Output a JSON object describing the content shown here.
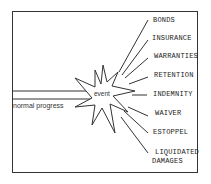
{
  "diagram": {
    "baseline_label": "normal progress",
    "event_label": "event",
    "consequences": [
      {
        "label": "BONDS",
        "x": 153,
        "y": 16
      },
      {
        "label": "INSURANCE",
        "x": 152,
        "y": 34
      },
      {
        "label": "WARRANTIES",
        "x": 154,
        "y": 52
      },
      {
        "label": "RETENTION",
        "x": 154,
        "y": 71
      },
      {
        "label": "INDEMNITY",
        "x": 153,
        "y": 90
      },
      {
        "label": "WAIVER",
        "x": 155,
        "y": 109
      },
      {
        "label": "ESTOPPEL",
        "x": 153,
        "y": 128
      },
      {
        "label": "LIQUIDATED",
        "x": 155,
        "y": 148
      },
      {
        "label": "DAMAGES",
        "x": 152,
        "y": 157
      }
    ],
    "colors": {
      "line": "#333333",
      "text": "#222222",
      "background": "#ffffff"
    }
  }
}
